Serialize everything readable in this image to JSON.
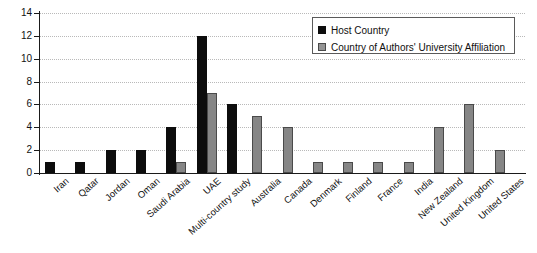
{
  "chart_data": {
    "type": "bar",
    "title": "",
    "xlabel": "",
    "ylabel": "",
    "ylim": [
      0,
      14
    ],
    "yticks": [
      0,
      2,
      4,
      6,
      8,
      10,
      12,
      14
    ],
    "grid": "horizontal-dotted",
    "legend_position": "top-right",
    "categories": [
      "Iran",
      "Qatar",
      "Jordan",
      "Oman",
      "Saudi Arabia",
      "UAE",
      "Multi-country study",
      "Australia",
      "Canada",
      "Denmark",
      "Finland",
      "France",
      "India",
      "New Zealand",
      "United Kingdom",
      "United States"
    ],
    "series": [
      {
        "name": "Host Country",
        "color": "#0d0d0d",
        "values": [
          1,
          1,
          2,
          2,
          4,
          12,
          6,
          0,
          0,
          0,
          0,
          0,
          0,
          0,
          0,
          0
        ]
      },
      {
        "name": "Country of Authors' University Affiliation",
        "color": "#868686",
        "values": [
          0,
          0,
          0,
          0,
          1,
          7,
          0,
          5,
          4,
          1,
          1,
          1,
          1,
          4,
          6,
          2
        ]
      }
    ]
  },
  "legend": {
    "items": [
      {
        "label": "Host Country",
        "swatch": "black-square-icon"
      },
      {
        "label": "Country of Authors' University Affiliation",
        "swatch": "gray-square-icon"
      }
    ]
  }
}
